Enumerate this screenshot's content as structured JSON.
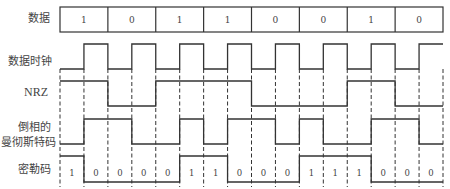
{
  "labels": {
    "data": "数据",
    "clock": "数据时钟",
    "nrz": "NRZ",
    "manchester_line1": "倒相的",
    "manchester_line2": "曼彻斯特码",
    "miller": "密勒码"
  },
  "colors": {
    "stroke": "#333333",
    "text": "#444444",
    "background": "#ffffff"
  },
  "geometry": {
    "x0": 60,
    "x1": 443,
    "data_box": {
      "top": 7,
      "bottom": 32
    },
    "clock": {
      "high": 44,
      "low": 69
    },
    "nrz": {
      "high": 81,
      "low": 106
    },
    "manchester": {
      "high": 119,
      "low": 144
    },
    "miller": {
      "high": 156,
      "low": 182
    },
    "dash": {
      "top": 69,
      "bottom": 187
    }
  },
  "data_bits": [
    "1",
    "0",
    "1",
    "1",
    "0",
    "0",
    "1",
    "0"
  ],
  "waveforms": {
    "clock": [
      0,
      1,
      0,
      1,
      0,
      1,
      0,
      1,
      0,
      1,
      0,
      1,
      0,
      1,
      0,
      1
    ],
    "nrz": [
      1,
      1,
      0,
      0,
      1,
      1,
      1,
      1,
      0,
      0,
      0,
      0,
      1,
      1,
      0,
      0
    ],
    "manchester": [
      0,
      1,
      1,
      0,
      0,
      1,
      0,
      1,
      1,
      0,
      1,
      0,
      0,
      1,
      1,
      0
    ],
    "miller": [
      1,
      0,
      0,
      0,
      0,
      1,
      1,
      0,
      0,
      0,
      1,
      1,
      1,
      0,
      0,
      0
    ]
  },
  "miller_labels": [
    "1",
    "0",
    "0",
    "0",
    "0",
    "1",
    "1",
    "0",
    "0",
    "0",
    "1",
    "1",
    "1",
    "0",
    "0",
    "0"
  ]
}
